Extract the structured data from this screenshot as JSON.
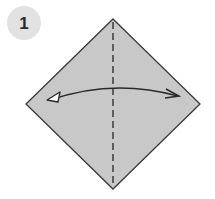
{
  "step": {
    "number": "1"
  },
  "diagram": {
    "shape": "square-diamond",
    "fill_color": "#c8c8c8",
    "edge_color": "#3a3a3a",
    "fold_line": "valley-fold-vertical-dashed",
    "arrow": "fold-and-unfold-left-right",
    "icons": [
      "dashed-fold-line",
      "fold-unfold-arrow"
    ]
  }
}
